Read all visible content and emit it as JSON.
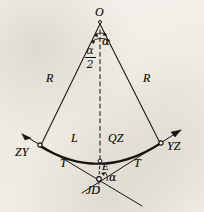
{
  "figure": {
    "background_color": "#f1eee7",
    "ink_color": "#17150f"
  },
  "points": {
    "center": {
      "label": "O",
      "x": 100,
      "y": 20
    },
    "curve_start": {
      "label": "ZY",
      "x": 40,
      "y": 146
    },
    "curve_end": {
      "label": "YZ",
      "x": 161,
      "y": 143
    },
    "curve_mid": {
      "label": "QZ",
      "x": 100,
      "y": 160
    },
    "external": {
      "label": "E",
      "x": 100,
      "y": 168
    },
    "intersection": {
      "label": "JD",
      "x": 98,
      "y": 179
    }
  },
  "labels": {
    "center_point": "O",
    "angle_alpha_top": "α",
    "angle_half_alpha_num": "α",
    "angle_half_alpha_den": "2",
    "radius_left": "R",
    "radius_right": "R",
    "curve_length": "L",
    "curve_midpoint": "QZ",
    "tangent_left": "T",
    "tangent_right": "T",
    "external_distance": "E",
    "start_of_curve": "ZY",
    "end_of_curve": "YZ",
    "intersection_point": "JD",
    "angle_alpha_bottom": "α"
  },
  "label_positions": {
    "center_point": {
      "x": 96,
      "y": 8
    },
    "angle_alpha_top": {
      "x": 102,
      "y": 36
    },
    "angle_half_alpha": {
      "x": 84,
      "y": 45
    },
    "radius_left": {
      "x": 48,
      "y": 78
    },
    "radius_right": {
      "x": 143,
      "y": 78
    },
    "curve_length": {
      "x": 72,
      "y": 139
    },
    "curve_midpoint": {
      "x": 110,
      "y": 139
    },
    "tangent_left": {
      "x": 62,
      "y": 163
    },
    "tangent_right": {
      "x": 135,
      "y": 163
    },
    "external_distance": {
      "x": 103,
      "y": 163
    },
    "start_of_curve": {
      "x": 17,
      "y": 148
    },
    "end_of_curve": {
      "x": 168,
      "y": 143
    },
    "intersection_point": {
      "x": 88,
      "y": 183
    },
    "angle_alpha_bottom": {
      "x": 110,
      "y": 173
    }
  },
  "bleed_text": [
    {
      "text": "",
      "x": 6,
      "y": 112
    },
    {
      "text": "",
      "x": 150,
      "y": 70
    },
    {
      "text": "",
      "x": 130,
      "y": 120
    },
    {
      "text": "",
      "x": 140,
      "y": 175
    },
    {
      "text": "",
      "x": 148,
      "y": 196
    }
  ]
}
